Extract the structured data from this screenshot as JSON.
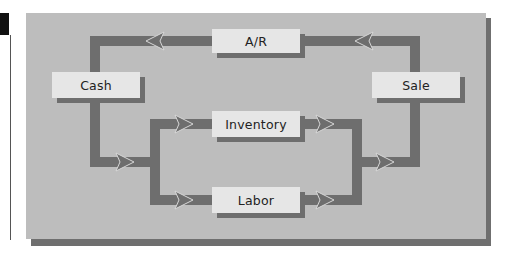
{
  "diagram": {
    "type": "flow-cycle",
    "title": "",
    "colors": {
      "panel": "#bdbdbd",
      "panel_shadow": "#6f6f6f",
      "arrow": "#6e6e6e",
      "arrow_highlight": "#d8d8d8",
      "node_fill": "#e6e6e6",
      "node_shadow": "#6e6e6e"
    },
    "nodes": [
      {
        "id": "ar",
        "label": "A/R"
      },
      {
        "id": "cash",
        "label": "Cash"
      },
      {
        "id": "sale",
        "label": "Sale"
      },
      {
        "id": "inventory",
        "label": "Inventory"
      },
      {
        "id": "labor",
        "label": "Labor"
      }
    ],
    "edges": [
      {
        "from": "sale",
        "to": "ar"
      },
      {
        "from": "ar",
        "to": "cash"
      },
      {
        "from": "cash",
        "to": "inventory"
      },
      {
        "from": "cash",
        "to": "labor"
      },
      {
        "from": "inventory",
        "to": "sale"
      },
      {
        "from": "labor",
        "to": "sale"
      }
    ]
  }
}
